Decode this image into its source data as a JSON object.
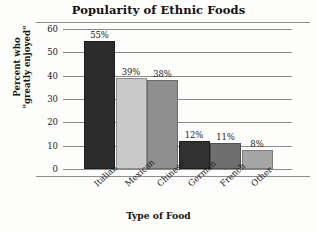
{
  "chart_data": {
    "type": "bar",
    "title": "Popularity of Ethnic Foods",
    "xlabel": "Type of Food",
    "ylabel_lines": [
      "Percent who",
      "\"greatly enjoyed\""
    ],
    "categories": [
      "Italian",
      "Mexican",
      "Chinese",
      "German",
      "French",
      "Other"
    ],
    "values": [
      55,
      39,
      38,
      12,
      11,
      8
    ],
    "value_labels": [
      "55%",
      "39%",
      "38%",
      "12%",
      "11%",
      "8%"
    ],
    "ylim": [
      0,
      60
    ],
    "yticks": [
      60,
      50,
      40,
      30,
      20,
      10,
      0
    ],
    "ytick_labels": [
      "60",
      "50",
      "40",
      "30",
      "20",
      "10",
      "0"
    ],
    "grid": true,
    "legend": "none",
    "bar_colors": [
      "#2c2c2c",
      "#c9c9c9",
      "#8f8f8f",
      "#323232",
      "#6e6e6e",
      "#a6a6a6"
    ],
    "bar_border_colors": [
      "#1d1d1d",
      "#8e8e8e",
      "#6a6a6a",
      "#1d1d1d",
      "#4f4f4f",
      "#7b7b7b"
    ],
    "axis_color": "#8b8b8b",
    "text_color": "#201c1a"
  }
}
